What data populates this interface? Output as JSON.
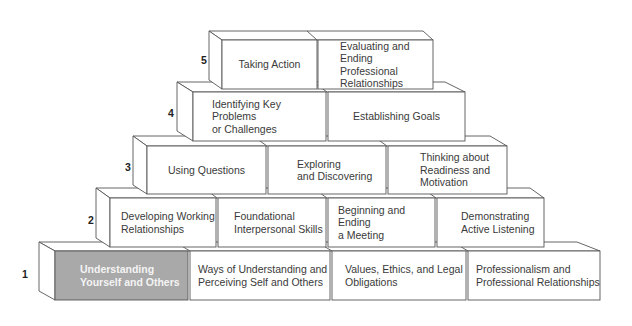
{
  "colors": {
    "stroke": "#555555",
    "face": "#ffffff",
    "highlight": "#a9a9a9",
    "highlight_text": "#f4f4f4"
  },
  "levels": [
    {
      "number": "1",
      "blocks": [
        {
          "label": "Understanding\nYourself and Others",
          "highlighted": true
        },
        {
          "label": "Ways of Understanding and\nPerceiving Self and Others"
        },
        {
          "label": "Values, Ethics, and Legal\nObligations"
        },
        {
          "label": "Professionalism and\nProfessional Relationships"
        }
      ]
    },
    {
      "number": "2",
      "blocks": [
        {
          "label": "Developing Working\nRelationships"
        },
        {
          "label": "Foundational\nInterpersonal Skills"
        },
        {
          "label": "Beginning and Ending\na Meeting"
        },
        {
          "label": "Demonstrating\nActive Listening"
        }
      ]
    },
    {
      "number": "3",
      "blocks": [
        {
          "label": "Using Questions"
        },
        {
          "label": "Exploring\nand Discovering"
        },
        {
          "label": "Thinking about\nReadiness and\nMotivation"
        }
      ]
    },
    {
      "number": "4",
      "blocks": [
        {
          "label": "Identifying Key Problems\nor Challenges"
        },
        {
          "label": "Establishing Goals"
        }
      ]
    },
    {
      "number": "5",
      "blocks": [
        {
          "label": "Taking Action"
        },
        {
          "label": "Evaluating and\nEnding Professional\nRelationships"
        }
      ]
    }
  ]
}
